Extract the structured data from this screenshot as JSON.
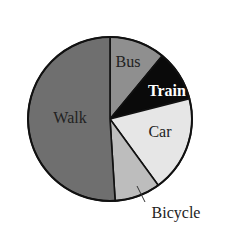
{
  "chart_data": {
    "type": "pie",
    "title": "",
    "start_angle_deg": 0,
    "direction": "clockwise",
    "slices": [
      {
        "label": "Bus",
        "value": 11,
        "color": "#8f8f8f",
        "label_color": "#2a2a2a",
        "label_bold": false
      },
      {
        "label": "Train",
        "value": 10,
        "color": "#0a0a0a",
        "label_color": "#ffffff",
        "label_bold": true
      },
      {
        "label": "Car",
        "value": 19,
        "color": "#e6e6e6",
        "label_color": "#2a2a2a",
        "label_bold": false
      },
      {
        "label": "Bicycle",
        "value": 9,
        "color": "#bdbdbd",
        "label_color": "#2a2a2a",
        "label_bold": false
      },
      {
        "label": "Walk",
        "value": 51,
        "color": "#6f6f6f",
        "label_color": "#1e1e1e",
        "label_bold": false
      }
    ],
    "categories": [
      "Bus",
      "Train",
      "Car",
      "Bicycle",
      "Walk"
    ],
    "values": [
      11,
      10,
      19,
      9,
      51
    ],
    "legend": "none (labels placed on slices; Bicycle uses external label with leader line)",
    "units": "percent (estimated from slice angles)"
  },
  "labels": {
    "bus": "Bus",
    "train": "Train",
    "car": "Car",
    "walk": "Walk",
    "bicycle": "Bicycle"
  }
}
